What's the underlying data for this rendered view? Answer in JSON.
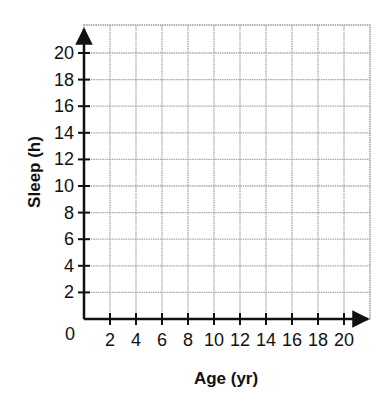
{
  "chart_data": {
    "type": "scatter",
    "title": "",
    "xlabel": "Age (yr)",
    "ylabel": "Sleep (h)",
    "origin_label": "0",
    "x_ticks": [
      2,
      4,
      6,
      8,
      10,
      12,
      14,
      16,
      18,
      20
    ],
    "y_ticks": [
      2,
      4,
      6,
      8,
      10,
      12,
      14,
      16,
      18,
      20
    ],
    "xlim": [
      0,
      22
    ],
    "ylim": [
      0,
      22
    ],
    "grid": true,
    "series": [],
    "legend": null
  },
  "colors": {
    "axis": "#111111",
    "grid": "#a8a8a8",
    "grid_border": "#9a9a9a",
    "text": "#111111"
  }
}
